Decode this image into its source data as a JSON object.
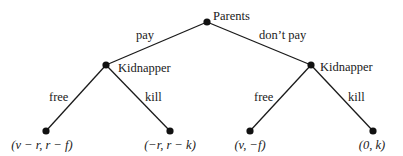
{
  "diagram": {
    "type": "game-tree",
    "nodes": {
      "root": {
        "player": "Parents",
        "x": 207,
        "y": 22
      },
      "left": {
        "player": "Kidnapper",
        "x": 106,
        "y": 65
      },
      "right": {
        "player": "Kidnapper",
        "x": 311,
        "y": 65
      }
    },
    "edges": {
      "pay": "pay",
      "dont_pay": "don’t pay",
      "left_free": "free",
      "left_kill": "kill",
      "right_free": "free",
      "right_kill": "kill"
    },
    "payoffs": {
      "pay_free": "(v − r, r − f)",
      "pay_kill": "(−r, r − k)",
      "dontpay_free": "(v, −f)",
      "dontpay_kill": "(0, k)"
    },
    "colors": {
      "line": "#1a1a1a",
      "node": "#111111",
      "background": "#ffffff"
    }
  }
}
